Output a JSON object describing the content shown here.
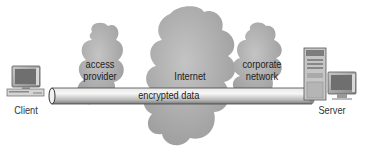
{
  "diagram": {
    "nodes": {
      "client": {
        "label": "Client"
      },
      "access_provider": {
        "line1": "access",
        "line2": "provider"
      },
      "internet": {
        "label": "Internet"
      },
      "corporate_network": {
        "line1": "corporate",
        "line2": "network"
      },
      "server": {
        "label": "Server"
      }
    },
    "tunnel": {
      "label": "encrypted data"
    },
    "colors": {
      "cloud": "#a8a8a8",
      "pipe_light": "#f0f0f0",
      "pipe_dark": "#8c8c8c",
      "text": "#222222"
    }
  }
}
